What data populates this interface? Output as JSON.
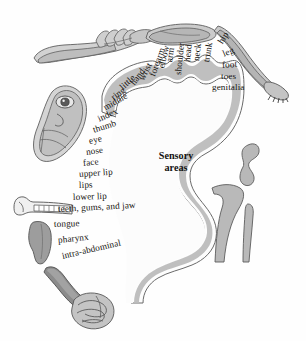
{
  "figure": {
    "center_label_line1": "Sensory",
    "center_label_line2": "areas",
    "palette": {
      "band_fill": "#b9b9b9",
      "band_stroke": "#6f6f6f",
      "cortex_interior": "#fdfdfd",
      "body_fill": "#cfcfcf",
      "body_shade": "#a8a8a8",
      "body_dark": "#8e8e8e",
      "tongue_fill": "#9a9a9a",
      "outline": "#5d5d5d",
      "text": "#15130f",
      "background": "#ffffff"
    }
  },
  "cortex_labels": [
    {
      "id": "genitalia",
      "text": "genitalia",
      "x": 212,
      "y": 87,
      "rot": 0
    },
    {
      "id": "toes",
      "text": "toes",
      "x": 221,
      "y": 76,
      "rot": 0
    },
    {
      "id": "foot",
      "text": "foot",
      "x": 222,
      "y": 65,
      "rot": -4
    },
    {
      "id": "leg",
      "text": "leg",
      "x": 223,
      "y": 54,
      "rot": -22
    },
    {
      "id": "hip",
      "text": "hip",
      "x": 220,
      "y": 43,
      "rot": -58
    },
    {
      "id": "trunk",
      "text": "trunk",
      "x": 206,
      "y": 62,
      "rot": -80
    },
    {
      "id": "neck",
      "text": "neck",
      "x": 196,
      "y": 61,
      "rot": -83
    },
    {
      "id": "head",
      "text": "head",
      "x": 187,
      "y": 62,
      "rot": -85
    },
    {
      "id": "shoulder",
      "text": "shoulder",
      "x": 178,
      "y": 75,
      "rot": -84
    },
    {
      "id": "arm",
      "text": "arm",
      "x": 169,
      "y": 62,
      "rot": -81
    },
    {
      "id": "elbow",
      "text": "elbow",
      "x": 161,
      "y": 68,
      "rot": -76
    },
    {
      "id": "forearm",
      "text": "forearm",
      "x": 152,
      "y": 76,
      "rot": -70
    },
    {
      "id": "wrist",
      "text": "wrist",
      "x": 141,
      "y": 80,
      "rot": -63
    },
    {
      "id": "hand",
      "text": "hand",
      "x": 132,
      "y": 84,
      "rot": -53
    },
    {
      "id": "little",
      "text": "little",
      "x": 121,
      "y": 88,
      "rot": -43
    },
    {
      "id": "ring",
      "text": "ring",
      "x": 112,
      "y": 98,
      "rot": -36
    },
    {
      "id": "middle",
      "text": "middle",
      "x": 104,
      "y": 108,
      "rot": -30
    },
    {
      "id": "index",
      "text": "index",
      "x": 98,
      "y": 119,
      "rot": -24
    },
    {
      "id": "thumb",
      "text": "thumb",
      "x": 93,
      "y": 130,
      "rot": -18
    },
    {
      "id": "eye",
      "text": "eye",
      "x": 89,
      "y": 141,
      "rot": -12
    },
    {
      "id": "nose",
      "text": "nose",
      "x": 86,
      "y": 152,
      "rot": -8
    },
    {
      "id": "face",
      "text": "face",
      "x": 83,
      "y": 163,
      "rot": -6
    },
    {
      "id": "upper-lip",
      "text": "upper lip",
      "x": 79,
      "y": 174,
      "rot": -4
    },
    {
      "id": "lips",
      "text": "lips",
      "x": 79,
      "y": 185,
      "rot": -2
    },
    {
      "id": "lower-lip",
      "text": "lower lip",
      "x": 73,
      "y": 197,
      "rot": -2
    },
    {
      "id": "teeth-gums-jaw",
      "text": "teeth, gums, and jaw",
      "x": 58,
      "y": 209,
      "rot": -3
    },
    {
      "id": "tongue",
      "text": "tongue",
      "x": 54,
      "y": 224,
      "rot": -2
    },
    {
      "id": "pharynx",
      "text": "pharynx",
      "x": 58,
      "y": 240,
      "rot": -6
    },
    {
      "id": "intra-abdominal",
      "text": "intra-abdominal",
      "x": 62,
      "y": 256,
      "rot": -13
    }
  ],
  "body_illustrations": [
    {
      "id": "arm-hand-figure",
      "name": "arm-and-hand-illustration"
    },
    {
      "id": "head-face-figure",
      "name": "head-and-face-illustration"
    },
    {
      "id": "torso-figure",
      "name": "torso-illustration"
    },
    {
      "id": "leg-foot-figure",
      "name": "leg-and-foot-illustration"
    },
    {
      "id": "genitalia-figure",
      "name": "genitalia-illustration"
    },
    {
      "id": "teeth-jaw-figure",
      "name": "teeth-and-jaw-illustration"
    },
    {
      "id": "tongue-figure",
      "name": "tongue-illustration"
    },
    {
      "id": "pharynx-figure",
      "name": "pharynx-illustration"
    },
    {
      "id": "intestines-figure",
      "name": "intra-abdominal-organs-illustration"
    }
  ]
}
